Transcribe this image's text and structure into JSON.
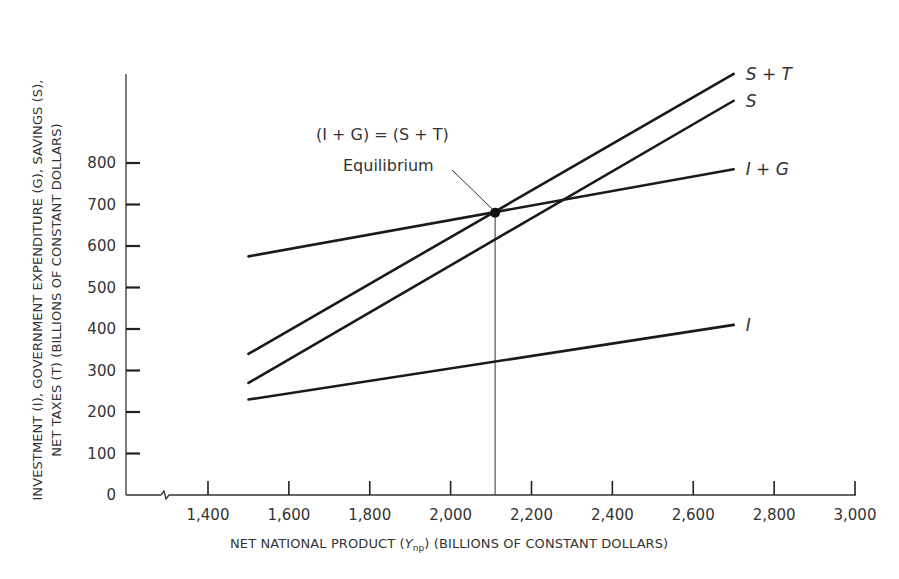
{
  "chart_data": {
    "type": "line",
    "title": "",
    "xlabel": "NET NATIONAL PRODUCT (Ynp) (BILLIONS OF CONSTANT DOLLARS)",
    "xlabel_parts": {
      "pre": "NET NATIONAL PRODUCT (",
      "var": "Y",
      "sub": "np",
      "post": ") (BILLIONS OF CONSTANT DOLLARS)"
    },
    "ylabel_line1": "INVESTMENT (I), GOVERNMENT EXPENDITURE (G), SAVINGS (S),",
    "ylabel_line2": "NET TAXES (T) (BILLIONS OF CONSTANT DOLLARS)",
    "xlim": [
      1200,
      3000
    ],
    "ylim": [
      0,
      900
    ],
    "x_axis_break": true,
    "grid": false,
    "x_ticks": [
      1400,
      1600,
      1800,
      2000,
      2200,
      2400,
      2600,
      2800,
      3000
    ],
    "x_tick_labels": [
      "1,400",
      "1,600",
      "1,800",
      "2,000",
      "2,200",
      "2,400",
      "2,600",
      "2,800",
      "3,000"
    ],
    "y_ticks": [
      0,
      100,
      200,
      300,
      400,
      500,
      600,
      700,
      800
    ],
    "y_tick_labels": [
      "0",
      "100",
      "200",
      "300",
      "400",
      "500",
      "600",
      "700",
      "800"
    ],
    "series": [
      {
        "name": "S + T",
        "x": [
          1500,
          2700
        ],
        "values": [
          340,
          1015
        ]
      },
      {
        "name": "S",
        "x": [
          1500,
          2700
        ],
        "values": [
          270,
          950
        ]
      },
      {
        "name": "I + G",
        "x": [
          1500,
          2700
        ],
        "values": [
          575,
          785
        ]
      },
      {
        "name": "I",
        "x": [
          1500,
          2700
        ],
        "values": [
          230,
          410
        ]
      }
    ],
    "annotations": [
      {
        "text": "(I + G) = (S + T)",
        "type": "label"
      },
      {
        "text": "Equilibrium",
        "type": "label",
        "points_to": {
          "x": 2110,
          "y": 680
        }
      }
    ],
    "equilibrium": {
      "x": 2110,
      "y": 680
    },
    "vertical_reference_line_x": 2110,
    "legend": "inline labels at right end of each line",
    "line_color": "#1a1a1a"
  }
}
